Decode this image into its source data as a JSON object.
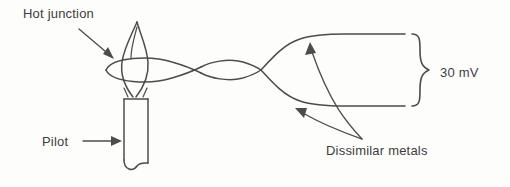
{
  "figure": {
    "kind": "thermocouple-pilot-diagram",
    "background_color": "#fdfdfc",
    "line_color": "#4c4c4c",
    "text_color": "#3d3d3d"
  },
  "labels": {
    "hot_junction": "Hot junction",
    "pilot": "Pilot",
    "dissimilar_metals": "Dissimilar metals",
    "output_voltage": "30 mV"
  },
  "annotations": {
    "hot_junction_arrow": "straight-arrow-down-right",
    "pilot_arrow": "straight-arrow-right",
    "dissimilar_metals_arrow_upper": "curved-arrow-up-left",
    "dissimilar_metals_arrow_lower": "curved-arrow-up-left",
    "voltage_brace": "right-curly-brace"
  },
  "parts": {
    "flame": "pilot-flame",
    "twisted_wires": "twisted-thermocouple-wires",
    "pilot_tube": "pilot-burner-tube",
    "lead_upper": "upper-lead-wire",
    "lead_lower": "lower-lead-wire"
  }
}
